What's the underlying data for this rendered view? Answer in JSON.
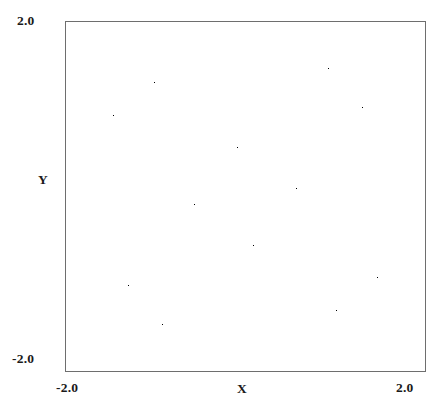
{
  "figure": {
    "width": 445,
    "height": 416,
    "background_color": "#ffffff",
    "plot_area": {
      "left": 65,
      "top": 21,
      "width": 361,
      "height": 351
    },
    "frame_color": "#6e6e6e",
    "point_color": "#000000"
  },
  "axes": {
    "x_title": "X",
    "y_title": "Y",
    "x_min_label": "-2.0",
    "x_max_label": "2.0",
    "y_min_label": "-2.0",
    "y_max_label": "2.0"
  },
  "chart_data": {
    "type": "scatter",
    "title": "",
    "subtitle": "",
    "xlabel": "X",
    "ylabel": "Y",
    "xlim": [
      -2.0,
      2.0
    ],
    "ylim": [
      -2.0,
      2.0
    ],
    "xticks": [
      -2.0,
      2.0
    ],
    "yticks": [
      -2.0,
      2.0
    ],
    "xticklabels": [
      "-2.0",
      "2.0"
    ],
    "yticklabels": [
      "-2.0",
      "2.0"
    ],
    "grid": false,
    "legend": null,
    "legend_position": "none",
    "marker_color": "#000000",
    "marker_size": 1,
    "series": [
      {
        "name": "attractor orbit",
        "generator": "gumowski-mira",
        "params": {
          "a": 0.0088,
          "b": 0.9979,
          "mu": -0.7509
        },
        "iterations": 420000,
        "burn_in": 1200,
        "seed": [
          0.1,
          0.1
        ],
        "symmetry_fold": 4,
        "n_points_plotted": 420000
      }
    ],
    "approx_extent": {
      "x": [
        -1.78,
        1.78
      ],
      "y": [
        -1.72,
        1.74
      ]
    },
    "core_feature": {
      "label": "dense cross-hatched core",
      "center": [
        0.02,
        -0.03
      ],
      "approx_size": [
        0.55,
        0.42
      ]
    },
    "arm_features": [
      {
        "label": "upper-left arm",
        "tip": [
          -1.05,
          1.42
        ]
      },
      {
        "label": "upper-right arm",
        "tip": [
          1.42,
          1.05
        ]
      },
      {
        "label": "lower-right arm",
        "tip": [
          1.05,
          -1.42
        ]
      },
      {
        "label": "lower-left arm",
        "tip": [
          -1.42,
          -1.05
        ]
      }
    ]
  }
}
